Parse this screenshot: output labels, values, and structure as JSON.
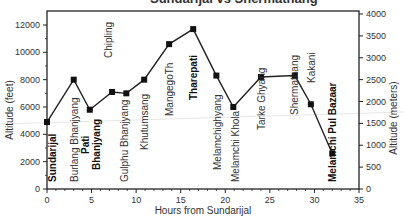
{
  "chart_data": {
    "type": "line",
    "title": "Sundarijal vs Shermathang",
    "xlabel": "Hours from Sundarijal",
    "ylabel": "Altitude (feet)",
    "y2label": "Altitude (meters)",
    "xlim": [
      0,
      35
    ],
    "ylim": [
      0,
      12800
    ],
    "y2lim": [
      0,
      4000
    ],
    "xticks": [
      0,
      5,
      10,
      15,
      20,
      25,
      30,
      35
    ],
    "yticks": [
      0,
      2000,
      4000,
      6000,
      8000,
      10000,
      12000
    ],
    "y2ticks": [
      0,
      500,
      1000,
      1500,
      2000,
      2500,
      3000,
      3500,
      4000
    ],
    "grid": false,
    "series": [
      {
        "name": "Trek altitude profile",
        "points": [
          {
            "label": "Sundarijal",
            "x": 0,
            "y": 4900,
            "bold": true
          },
          {
            "label": "Burlang Bhanjyang",
            "x": 3,
            "y": 8000,
            "bold": false
          },
          {
            "label": "Pati Bhanjyang",
            "x": 4.8,
            "y": 5800,
            "bold": true
          },
          {
            "label": "Chipling",
            "x": 7.3,
            "y": 7100,
            "bold": false
          },
          {
            "label": "Gulphu Bhanjyang",
            "x": 8.9,
            "y": 7000,
            "bold": false
          },
          {
            "label": "Khutumsang",
            "x": 10.9,
            "y": 8000,
            "bold": false
          },
          {
            "label": "MangegoTh",
            "x": 13.7,
            "y": 10600,
            "bold": false
          },
          {
            "label": "Tharepati",
            "x": 16.4,
            "y": 11700,
            "bold": true
          },
          {
            "label": "Melamchighyang",
            "x": 19,
            "y": 8300,
            "bold": false
          },
          {
            "label": "Melamchi Khola",
            "x": 20.9,
            "y": 6000,
            "bold": false
          },
          {
            "label": "Tarke Ghyang",
            "x": 24,
            "y": 8200,
            "bold": false
          },
          {
            "label": "Shermathang",
            "x": 27.8,
            "y": 8300,
            "bold": false
          },
          {
            "label": "Kakani",
            "x": 29.6,
            "y": 6200,
            "bold": false
          },
          {
            "label": "Melamchi Pul Bazaar",
            "x": 32,
            "y": 2600,
            "bold": true
          }
        ]
      }
    ]
  }
}
